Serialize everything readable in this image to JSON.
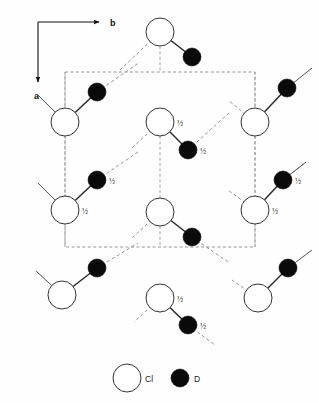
{
  "figure": {
    "background_color": "#fefefe",
    "line_color": "#555555",
    "atom_outline_color": "#333333",
    "d_atom_color": "#0a0a0a",
    "cl_atom_fill": "#ffffff"
  },
  "axes": {
    "horizontal": {
      "label": "b",
      "direction": "right"
    },
    "vertical": {
      "label": "a",
      "direction": "down"
    },
    "origin": {
      "x": 38,
      "y": 22
    },
    "b_end": {
      "x": 105,
      "y": 22
    },
    "a_end": {
      "x": 38,
      "y": 88
    }
  },
  "unit_cell": {
    "style": "dashed",
    "x": 65,
    "y": 72,
    "width": 190,
    "height": 175,
    "color": "#8a8a8a"
  },
  "legend": {
    "cl": {
      "label": "Cl",
      "symbol": "open-circle",
      "cx": 127,
      "cy": 378,
      "r": 14
    },
    "d": {
      "label": "D",
      "symbol": "filled-circle",
      "cx": 180,
      "cy": 378,
      "r": 9
    }
  },
  "atoms": {
    "cl": [
      {
        "id": "cl-top-center",
        "cx": 160,
        "cy": 32,
        "r": 14,
        "frac": ""
      },
      {
        "id": "cl-row2-left",
        "cx": 65,
        "cy": 122,
        "r": 14,
        "frac": ""
      },
      {
        "id": "cl-row2-center",
        "cx": 160,
        "cy": 122,
        "r": 14,
        "frac": "½"
      },
      {
        "id": "cl-row2-right",
        "cx": 255,
        "cy": 122,
        "r": 14,
        "frac": ""
      },
      {
        "id": "cl-row3-left",
        "cx": 65,
        "cy": 210,
        "r": 14,
        "frac": "½"
      },
      {
        "id": "cl-row3-center",
        "cx": 160,
        "cy": 212,
        "r": 14,
        "frac": ""
      },
      {
        "id": "cl-row3-right",
        "cx": 255,
        "cy": 210,
        "r": 14,
        "frac": "½"
      },
      {
        "id": "cl-row4-left",
        "cx": 62,
        "cy": 295,
        "r": 14,
        "frac": ""
      },
      {
        "id": "cl-row4-center",
        "cx": 160,
        "cy": 298,
        "r": 14,
        "frac": "½"
      },
      {
        "id": "cl-row4-right",
        "cx": 258,
        "cy": 298,
        "r": 14,
        "frac": ""
      }
    ],
    "d": [
      {
        "id": "d-top-right",
        "cx": 192,
        "cy": 57,
        "r": 9,
        "frac": ""
      },
      {
        "id": "d-upper-left",
        "cx": 97,
        "cy": 92,
        "r": 9,
        "frac": ""
      },
      {
        "id": "d-upper-right",
        "cx": 287,
        "cy": 88,
        "r": 9,
        "frac": ""
      },
      {
        "id": "d-mid-center",
        "cx": 188,
        "cy": 150,
        "r": 9,
        "frac": "½"
      },
      {
        "id": "d-mid-left",
        "cx": 97,
        "cy": 180,
        "r": 9,
        "frac": "½"
      },
      {
        "id": "d-mid-right",
        "cx": 283,
        "cy": 180,
        "r": 9,
        "frac": "½"
      },
      {
        "id": "d-low-center",
        "cx": 192,
        "cy": 237,
        "r": 9,
        "frac": ""
      },
      {
        "id": "d-low-left",
        "cx": 97,
        "cy": 268,
        "r": 9,
        "frac": ""
      },
      {
        "id": "d-low-right",
        "cx": 288,
        "cy": 268,
        "r": 9,
        "frac": ""
      },
      {
        "id": "d-bottom-center",
        "cx": 188,
        "cy": 325,
        "r": 9,
        "frac": "½"
      }
    ]
  },
  "bonds_solid": [
    {
      "x1": 160,
      "y1": 32,
      "x2": 192,
      "y2": 57
    },
    {
      "x1": 65,
      "y1": 122,
      "x2": 97,
      "y2": 92
    },
    {
      "x1": 255,
      "y1": 122,
      "x2": 287,
      "y2": 88
    },
    {
      "x1": 160,
      "y1": 122,
      "x2": 188,
      "y2": 150
    },
    {
      "x1": 65,
      "y1": 210,
      "x2": 97,
      "y2": 180
    },
    {
      "x1": 255,
      "y1": 210,
      "x2": 283,
      "y2": 180
    },
    {
      "x1": 160,
      "y1": 212,
      "x2": 192,
      "y2": 237
    },
    {
      "x1": 62,
      "y1": 295,
      "x2": 97,
      "y2": 268
    },
    {
      "x1": 258,
      "y1": 298,
      "x2": 288,
      "y2": 268
    },
    {
      "x1": 160,
      "y1": 298,
      "x2": 188,
      "y2": 325
    }
  ],
  "bonds_dashed": [
    {
      "x1": 192,
      "y1": 57,
      "x2": 160,
      "y2": 32,
      "note": "top-bridge-left"
    },
    {
      "x1": 160,
      "y1": 32,
      "x2": 120,
      "y2": 70
    },
    {
      "x1": 97,
      "y1": 92,
      "x2": 140,
      "y2": 62
    },
    {
      "x1": 188,
      "y1": 150,
      "x2": 230,
      "y2": 112
    },
    {
      "x1": 97,
      "y1": 180,
      "x2": 138,
      "y2": 152
    },
    {
      "x1": 192,
      "y1": 237,
      "x2": 228,
      "y2": 262
    },
    {
      "x1": 97,
      "y1": 268,
      "x2": 138,
      "y2": 243
    },
    {
      "x1": 283,
      "y1": 180,
      "x2": 305,
      "y2": 163
    },
    {
      "x1": 188,
      "y1": 325,
      "x2": 215,
      "y2": 345
    }
  ],
  "stub_bonds": [
    {
      "x1": 65,
      "y1": 122,
      "x2": 38,
      "y2": 95
    },
    {
      "x1": 65,
      "y1": 210,
      "x2": 38,
      "y2": 183
    },
    {
      "x1": 62,
      "y1": 295,
      "x2": 36,
      "y2": 271
    },
    {
      "x1": 287,
      "y1": 88,
      "x2": 312,
      "y2": 68
    },
    {
      "x1": 288,
      "y1": 268,
      "x2": 312,
      "y2": 250
    },
    {
      "x1": 283,
      "y1": 180,
      "x2": 306,
      "y2": 162
    },
    {
      "x1": 160,
      "y1": 122,
      "x2": 132,
      "y2": 148
    },
    {
      "x1": 160,
      "y1": 212,
      "x2": 132,
      "y2": 238
    },
    {
      "x1": 160,
      "y1": 298,
      "x2": 134,
      "y2": 322
    },
    {
      "x1": 255,
      "y1": 122,
      "x2": 228,
      "y2": 100
    },
    {
      "x1": 255,
      "y1": 210,
      "x2": 228,
      "y2": 190
    },
    {
      "x1": 258,
      "y1": 298,
      "x2": 232,
      "y2": 280
    }
  ],
  "cell_connectors": [
    {
      "x1": 65,
      "y1": 72,
      "x2": 65,
      "y2": 108
    },
    {
      "x1": 65,
      "y1": 136,
      "x2": 65,
      "y2": 196
    },
    {
      "x1": 65,
      "y1": 224,
      "x2": 65,
      "y2": 247
    },
    {
      "x1": 255,
      "y1": 72,
      "x2": 255,
      "y2": 108
    },
    {
      "x1": 255,
      "y1": 136,
      "x2": 255,
      "y2": 196
    },
    {
      "x1": 255,
      "y1": 224,
      "x2": 255,
      "y2": 247
    },
    {
      "x1": 160,
      "y1": 136,
      "x2": 160,
      "y2": 198
    },
    {
      "x1": 160,
      "y1": 226,
      "x2": 160,
      "y2": 247
    },
    {
      "x1": 160,
      "y1": 46,
      "x2": 160,
      "y2": 72
    }
  ]
}
